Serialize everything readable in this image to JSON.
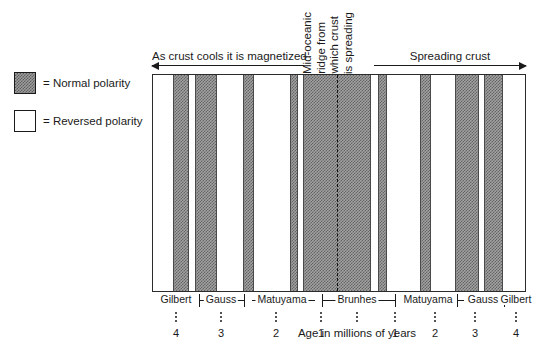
{
  "legend": {
    "items": [
      {
        "swatch": "normal-polarity-swatch",
        "label": "= Normal polarity"
      },
      {
        "swatch": "reversed-polarity-swatch",
        "label": "= Reversed polarity"
      }
    ]
  },
  "annotations": {
    "left_arrow_caption": "As crust cools it is magnetized",
    "right_arrow_caption": "Spreading crust",
    "ridge_caption_lines": [
      "Mid-oceanic",
      "ridge from",
      "which crust",
      "is spreading"
    ]
  },
  "axis": {
    "title": "Age in millions of years",
    "ticks_left": [
      "4",
      "3",
      "2",
      "1"
    ],
    "ticks_right": [
      "1",
      "2",
      "3",
      "4"
    ]
  },
  "epochs": {
    "labels": [
      "Gilbert",
      "Gauss",
      "Matuyama",
      "Brunhes",
      "Matuyama",
      "Gauss",
      "Gilbert"
    ]
  },
  "chart_data": {
    "type": "bar",
    "xlabel": "Age in millions of years",
    "ylabel": "",
    "grid": false,
    "legend_position": "left-outside",
    "legend_entries": [
      "Normal polarity",
      "Reversed polarity"
    ],
    "axis_domain_percent": [
      0,
      100
    ],
    "ridge_center_percent": 50,
    "categories": [
      "Gilbert (left)",
      "Gauss (left)",
      "Matuyama (left)",
      "Brunhes",
      "Matuyama (right)",
      "Gauss (right)",
      "Gilbert (right)"
    ],
    "epoch_boundaries_percent": [
      0,
      7.5,
      22.5,
      42.5,
      57.5,
      77.5,
      92.5,
      100
    ],
    "stripes": [
      {
        "polarity": "reversed",
        "start_percent": 0.0,
        "end_percent": 7.0,
        "epoch": "Gilbert (left)"
      },
      {
        "polarity": "normal",
        "start_percent": 7.0,
        "end_percent": 13.0,
        "epoch": "Gauss (left)"
      },
      {
        "polarity": "reversed",
        "start_percent": 13.0,
        "end_percent": 15.0,
        "epoch": "Gauss (left)"
      },
      {
        "polarity": "normal",
        "start_percent": 15.0,
        "end_percent": 23.0,
        "epoch": "Gauss (left)"
      },
      {
        "polarity": "reversed",
        "start_percent": 23.0,
        "end_percent": 32.0,
        "epoch": "Matuyama (left)"
      },
      {
        "polarity": "normal",
        "start_percent": 32.0,
        "end_percent": 36.0,
        "epoch": "Matuyama (left)"
      },
      {
        "polarity": "reversed",
        "start_percent": 36.0,
        "end_percent": 49.0,
        "epoch": "Matuyama (left)"
      },
      {
        "polarity": "normal",
        "start_percent": 49.0,
        "end_percent": 52.0,
        "epoch": "Matuyama (left)"
      },
      {
        "polarity": "reversed",
        "start_percent": 52.0,
        "end_percent": 53.5,
        "epoch": "Matuyama (left)"
      },
      {
        "polarity": "normal",
        "start_percent": 53.5,
        "end_percent": 78.0,
        "epoch": "Brunhes"
      },
      {
        "polarity": "reversed",
        "start_percent": 78.0,
        "end_percent": 80.5,
        "epoch": "Matuyama (right)"
      },
      {
        "polarity": "normal",
        "start_percent": 80.5,
        "end_percent": 83.5,
        "epoch": "Matuyama (right)"
      },
      {
        "polarity": "reversed",
        "start_percent": 83.5,
        "end_percent": 95.5,
        "epoch": "Matuyama (right)"
      },
      {
        "polarity": "normal",
        "start_percent": 95.5,
        "end_percent": 99.5,
        "epoch": "Matuyama (right)"
      },
      {
        "polarity": "reversed",
        "start_percent": 99.5,
        "end_percent": 108.0,
        "epoch": "Gauss (right)"
      },
      {
        "polarity": "normal",
        "start_percent": 108.0,
        "end_percent": 116.5,
        "epoch": "Gauss (right)"
      },
      {
        "polarity": "reversed",
        "start_percent": 116.5,
        "end_percent": 118.5,
        "epoch": "Gauss (right)"
      },
      {
        "polarity": "normal",
        "start_percent": 118.5,
        "end_percent": 125.0,
        "epoch": "Gauss (right)"
      },
      {
        "polarity": "reversed",
        "start_percent": 125.0,
        "end_percent": 133.0,
        "epoch": "Gilbert (right)"
      }
    ],
    "colors": {
      "normal": "#9d9d9d",
      "reversed": "#ffffff",
      "outline": "#2b2b2b",
      "ridge_axis": "#101010"
    }
  }
}
